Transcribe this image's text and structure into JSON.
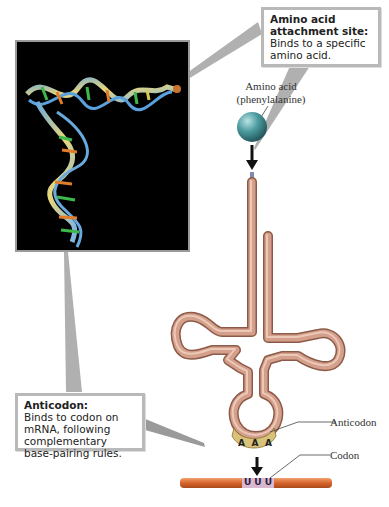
{
  "callouts": {
    "attachment_site": {
      "title": "Amino acid attachment site:",
      "body": "Binds to a specific amino acid."
    },
    "anticodon": {
      "title": "Anticodon:",
      "body": "Binds to codon on mRNA, following complementary base-pairing rules."
    }
  },
  "labels": {
    "amino_acid_line1": "Amino acid",
    "amino_acid_line2": "(phenylalanine)",
    "anticodon": "Anticodon",
    "codon": "Codon"
  },
  "bases": {
    "anticodon": [
      "A",
      "A",
      "A"
    ],
    "codon": [
      "U",
      "U",
      "U"
    ]
  },
  "colors": {
    "trna_tube": "#d4a08c",
    "trna_tube_edge": "#9e6a58",
    "mrna": "#d8642a",
    "anticodon_cap": "#d9c27a",
    "codon_highlight": "#d8b7d0",
    "amino_acid_ball": "#4e9ca0",
    "photo_bg": "#000000",
    "callout_border": "#b9b9b9",
    "pointer": "#a8a8a8"
  }
}
